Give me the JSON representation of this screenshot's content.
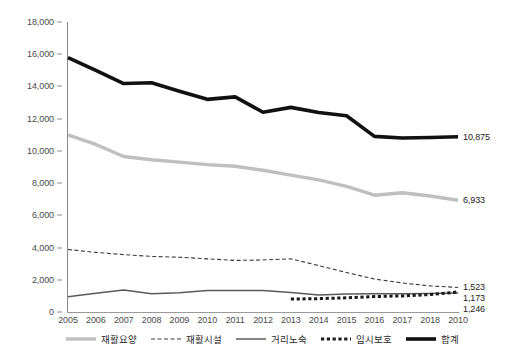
{
  "chart_data": {
    "type": "line",
    "title": "",
    "subtitle": "",
    "xlabel": "",
    "ylabel": "",
    "xlim": [
      2005,
      2019
    ],
    "ylim": [
      0,
      18000
    ],
    "ytick_step": 2000,
    "grid": false,
    "legend_position": "bottom",
    "x": [
      2005,
      2006,
      2007,
      2008,
      2009,
      2010,
      2011,
      2012,
      2013,
      2014,
      2015,
      2016,
      2017,
      2018,
      2019
    ],
    "tick_labels": {
      "x": [
        "2005",
        "2006",
        "2007",
        "2008",
        "2009",
        "2010",
        "2011",
        "2012",
        "2013",
        "2014",
        "2015",
        "2016",
        "2017",
        "2018",
        "2010"
      ],
      "y": [
        "0",
        "2,000",
        "4,000",
        "6,000",
        "8,000",
        "10,000",
        "12,000",
        "14,000",
        "16,000",
        "18,000"
      ]
    },
    "series": [
      {
        "name": "재활요양",
        "style": "solid",
        "color": "#bfbfbf",
        "width": 3.4,
        "values": [
          11000,
          10400,
          9650,
          9450,
          9300,
          9150,
          9050,
          8800,
          8500,
          8200,
          7800,
          7250,
          7400,
          7200,
          6933
        ],
        "end_label": "6,933"
      },
      {
        "name": "재활시설",
        "style": "dashed",
        "color": "#3a3a3a",
        "width": 1.1,
        "values": [
          3880,
          3700,
          3560,
          3450,
          3400,
          3300,
          3200,
          3230,
          3300,
          2880,
          2450,
          2050,
          1800,
          1620,
          1523
        ],
        "end_label": "1,523"
      },
      {
        "name": "거리노숙",
        "style": "solid",
        "color": "#5a5a5a",
        "width": 1.5,
        "values": [
          950,
          1160,
          1360,
          1140,
          1200,
          1340,
          1340,
          1330,
          1210,
          1060,
          1120,
          1130,
          1140,
          1150,
          1173
        ],
        "end_label": "1,173"
      },
      {
        "name": "임시보호",
        "style": "dotted",
        "color": "#1a1a1a",
        "width": 3.0,
        "values": [
          null,
          null,
          null,
          null,
          null,
          null,
          null,
          null,
          800,
          830,
          880,
          960,
          1000,
          1080,
          1246
        ],
        "end_label": "1,246"
      },
      {
        "name": "합계",
        "style": "solid",
        "color": "#111111",
        "width": 3.6,
        "values": [
          15790,
          15000,
          14180,
          14230,
          13700,
          13200,
          13350,
          12400,
          12700,
          12380,
          12180,
          10900,
          10800,
          10830,
          10875
        ],
        "end_label": "10,875"
      }
    ]
  },
  "legend": {
    "items": [
      {
        "label": "재활요양",
        "swatch": "thick-gray-solid"
      },
      {
        "label": "재활시설",
        "swatch": "thin-dashed"
      },
      {
        "label": "거리노숙",
        "swatch": "thin-solid"
      },
      {
        "label": "임시보호",
        "swatch": "thick-dotted"
      },
      {
        "label": "합계",
        "swatch": "thick-black-solid"
      }
    ]
  }
}
